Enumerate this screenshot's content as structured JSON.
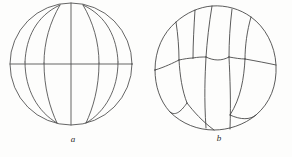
{
  "plate": {
    "background_color": "#fdfdfc",
    "ink_color": "#4a4a4a",
    "figure_count": 2
  },
  "figures": [
    {
      "id": "a",
      "caption": "a",
      "description": "spherical egg in uncleaved / meridional-furrow stage",
      "outline": "circle",
      "center": {
        "x": 71,
        "y": 64
      },
      "radius": 61,
      "internal_lines": [
        {
          "name": "equatorial-line",
          "type": "straight-horizontal"
        },
        {
          "name": "polar-axis-line",
          "type": "straight-vertical"
        },
        {
          "name": "left-meridian-curve",
          "type": "curved"
        },
        {
          "name": "right-meridian-curve",
          "type": "curved"
        }
      ]
    },
    {
      "id": "b",
      "caption": "b",
      "description": "spherical embryo subdivided into polygonal blastomeres",
      "outline": "lobed-circle",
      "center": {
        "x": 71,
        "y": 66
      },
      "radius": 62,
      "cell_count": 12,
      "internal_lines": [
        {
          "name": "cell-wall-1",
          "type": "curved"
        },
        {
          "name": "cell-wall-2",
          "type": "curved"
        },
        {
          "name": "cell-wall-3",
          "type": "curved"
        },
        {
          "name": "cell-wall-4",
          "type": "curved"
        },
        {
          "name": "cell-wall-5",
          "type": "curved"
        },
        {
          "name": "cell-wall-6",
          "type": "curved"
        },
        {
          "name": "cell-wall-7",
          "type": "curved"
        },
        {
          "name": "cell-wall-8",
          "type": "curved"
        },
        {
          "name": "cell-wall-9",
          "type": "curved"
        },
        {
          "name": "cell-wall-10",
          "type": "curved"
        }
      ]
    }
  ]
}
